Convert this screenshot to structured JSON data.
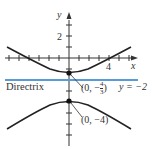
{
  "axes": {
    "x_label": "x",
    "y_label": "y",
    "x_tick_label": "4",
    "y_tick_label": "2"
  },
  "directrix": {
    "label": "Directrix",
    "equation": "y = −2",
    "color": "#5b9bd5"
  },
  "points": [
    {
      "label_prefix": "(0, −",
      "num": "4",
      "den": "3",
      "label_suffix": ")"
    },
    {
      "label": "(0, −4)"
    }
  ],
  "colors": {
    "curve": "#222222",
    "axis": "#333333"
  }
}
